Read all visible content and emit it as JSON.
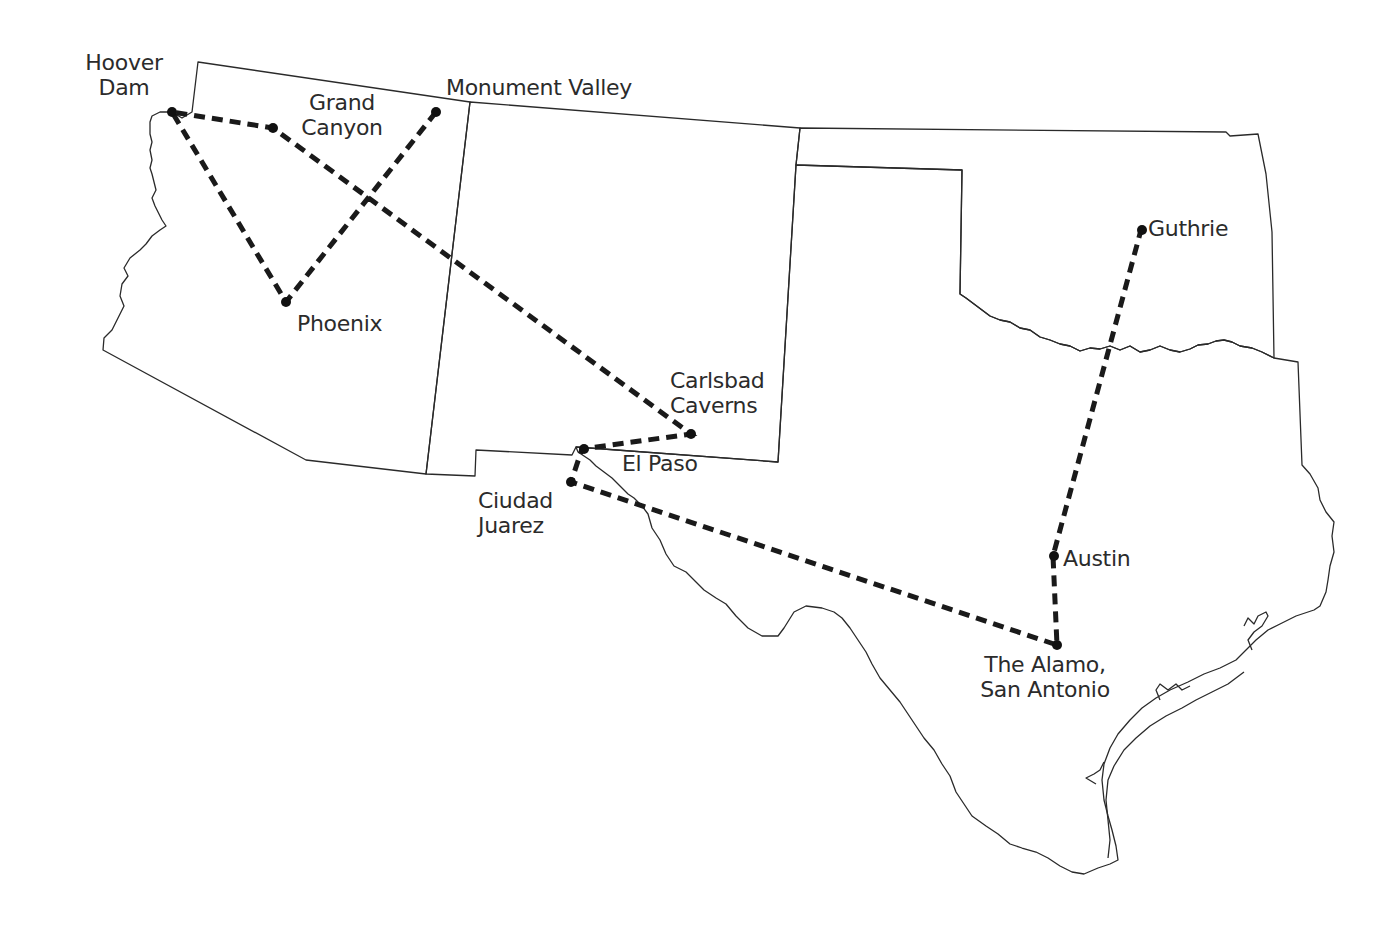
{
  "map": {
    "title": "Southwest Road Trip",
    "colors": {
      "border": "#2a2a2a",
      "route": "#1a1a1a",
      "background": "#ffffff",
      "text": "#2b2b2b"
    },
    "places": [
      {
        "id": "hoover-dam",
        "label": "Hoover\nDam"
      },
      {
        "id": "grand-canyon",
        "label": "Grand\nCanyon"
      },
      {
        "id": "monument-valley",
        "label": "Monument Valley"
      },
      {
        "id": "phoenix",
        "label": "Phoenix"
      },
      {
        "id": "carlsbad-caverns",
        "label": "Carlsbad\nCaverns"
      },
      {
        "id": "el-paso",
        "label": "El Paso"
      },
      {
        "id": "ciudad-juarez",
        "label": "Ciudad\nJuarez"
      },
      {
        "id": "the-alamo",
        "label": "The Alamo,\nSan Antonio"
      },
      {
        "id": "austin",
        "label": "Austin"
      },
      {
        "id": "guthrie",
        "label": "Guthrie"
      }
    ],
    "route_order": [
      "monument-valley",
      "phoenix",
      "hoover-dam",
      "grand-canyon",
      "carlsbad-caverns",
      "el-paso",
      "ciudad-juarez",
      "the-alamo",
      "austin",
      "guthrie"
    ],
    "states": [
      "Arizona",
      "New Mexico",
      "Texas",
      "Oklahoma"
    ]
  }
}
